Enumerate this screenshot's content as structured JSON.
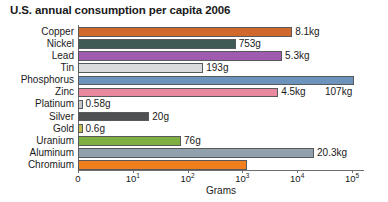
{
  "chart_data": {
    "type": "bar",
    "orientation": "horizontal",
    "title": "U.S. annual consumption per capita 2006",
    "xlabel": "Grams",
    "ylabel": "",
    "xscale": "log",
    "xlim": [
      1,
      100000
    ],
    "grid": false,
    "legend": "none",
    "categories": [
      "Copper",
      "Nickel",
      "Lead",
      "Tin",
      "Phosphorus",
      "Zinc",
      "Platinum",
      "Silver",
      "Gold",
      "Uranium",
      "Aluminum",
      "Chromium"
    ],
    "values": [
      8100,
      753,
      5300,
      193,
      107000,
      4500,
      0.58,
      20,
      0.6,
      76,
      20300,
      1200
    ],
    "value_labels": [
      "8.1kg",
      "753g",
      "5.3kg",
      "193g",
      "107kg",
      "4.5kg",
      "0.58g",
      "20g",
      "0.6g",
      "76g",
      "20.3kg",
      ""
    ],
    "bar_colors": [
      "#d0692b",
      "#3f5b55",
      "#a05bb0",
      "#dadbdc",
      "#6b93bc",
      "#e8899f",
      "#c6c7c9",
      "#4f5052",
      "#c2bb4f",
      "#7fae43",
      "#91a0ad",
      "#f0801e"
    ],
    "tick_labels": [
      "0",
      "10",
      "10",
      "10",
      "10",
      "10"
    ],
    "tick_exponents": [
      "",
      "1",
      "2",
      "3",
      "4",
      "5"
    ],
    "tick_positions_px": [
      78,
      132.8,
      187.6,
      242.4,
      297.2,
      352
    ]
  }
}
